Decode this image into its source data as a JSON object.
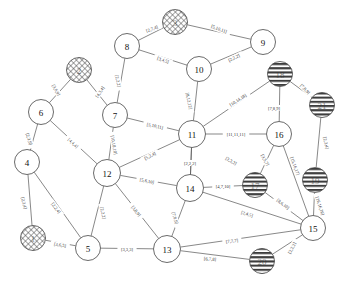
{
  "diagram": {
    "type": "undirected-weighted-graph",
    "title": "",
    "width": 347,
    "height": 285,
    "background": "#ffffff",
    "node_fill": "#ffffff",
    "node_stroke": "#444444",
    "edge_stroke": "#555555",
    "label_color": "#333333",
    "node_styles": {
      "plain": "white circle with black outline",
      "crosshatch": "circle filled with diagonal cross-hatch pattern (obscured label)",
      "stripe": "circle filled with horizontal stripe pattern (obscured label)"
    },
    "nodes": [
      {
        "id": "n3",
        "label": "3",
        "x": 175,
        "y": 22,
        "r": 12.5,
        "style": "crosshatch"
      },
      {
        "id": "n8",
        "label": "8",
        "x": 127,
        "y": 46,
        "r": 12.5,
        "style": "plain"
      },
      {
        "id": "n9",
        "label": "9",
        "x": 263,
        "y": 42,
        "r": 12.5,
        "style": "plain"
      },
      {
        "id": "n10",
        "label": "10",
        "x": 199,
        "y": 69,
        "r": 12.5,
        "style": "plain"
      },
      {
        "id": "n2",
        "label": "2",
        "x": 79,
        "y": 70,
        "r": 12.5,
        "style": "crosshatch"
      },
      {
        "id": "n18",
        "label": "18",
        "x": 280,
        "y": 74,
        "r": 12.5,
        "style": "stripe"
      },
      {
        "id": "n7",
        "label": "7",
        "x": 115,
        "y": 115,
        "r": 12.5,
        "style": "plain"
      },
      {
        "id": "n6",
        "label": "6",
        "x": 41,
        "y": 112,
        "r": 12.5,
        "style": "plain"
      },
      {
        "id": "n21",
        "label": "21",
        "x": 322,
        "y": 105,
        "r": 12.5,
        "style": "stripe"
      },
      {
        "id": "n11",
        "label": "11",
        "x": 192,
        "y": 134,
        "r": 13.5,
        "style": "plain"
      },
      {
        "id": "n16",
        "label": "16",
        "x": 279,
        "y": 134,
        "r": 12.5,
        "style": "plain"
      },
      {
        "id": "n4",
        "label": "4",
        "x": 27,
        "y": 162,
        "r": 12.5,
        "style": "plain"
      },
      {
        "id": "n12",
        "label": "12",
        "x": 107,
        "y": 173,
        "r": 13.5,
        "style": "plain"
      },
      {
        "id": "n14",
        "label": "14",
        "x": 190,
        "y": 188,
        "r": 13.5,
        "style": "plain"
      },
      {
        "id": "n17",
        "label": "17",
        "x": 255,
        "y": 185,
        "r": 12.5,
        "style": "stripe"
      },
      {
        "id": "n19",
        "label": "19",
        "x": 315,
        "y": 180,
        "r": 12.5,
        "style": "stripe"
      },
      {
        "id": "n15",
        "label": "15",
        "x": 313,
        "y": 228,
        "r": 12.5,
        "style": "plain"
      },
      {
        "id": "n1",
        "label": "1",
        "x": 33,
        "y": 238,
        "r": 12.5,
        "style": "crosshatch"
      },
      {
        "id": "n5",
        "label": "5",
        "x": 88,
        "y": 248,
        "r": 12.5,
        "style": "plain"
      },
      {
        "id": "n13",
        "label": "13",
        "x": 167,
        "y": 249,
        "r": 13.5,
        "style": "plain"
      },
      {
        "id": "n20",
        "label": "20",
        "x": 262,
        "y": 261,
        "r": 12.5,
        "style": "stripe"
      }
    ],
    "edges": [
      {
        "from": "n8",
        "to": "n3",
        "label": "[2,7,4]",
        "lx": 152,
        "ly": 29,
        "rot": -21
      },
      {
        "from": "n3",
        "to": "n9",
        "label": "[5,10,11]",
        "lx": 219,
        "ly": 29,
        "rot": 20
      },
      {
        "from": "n8",
        "to": "n10",
        "label": "[3,4,5]",
        "lx": 163,
        "ly": 60,
        "rot": 19
      },
      {
        "from": "n10",
        "to": "n9",
        "label": "[2,2,2]",
        "lx": 234,
        "ly": 58,
        "rot": -26
      },
      {
        "from": "n8",
        "to": "n7",
        "label": "[2,2,2]",
        "lx": 118,
        "ly": 81,
        "rot": 78
      },
      {
        "from": "n2",
        "to": "n6",
        "label": "[3,6,9]",
        "lx": 56,
        "ly": 90,
        "rot": 60
      },
      {
        "from": "n2",
        "to": "n7",
        "label": "[4,3,4]",
        "lx": 100,
        "ly": 92,
        "rot": -56
      },
      {
        "from": "n10",
        "to": "n11",
        "label": "[8,12,12]",
        "lx": 189,
        "ly": 101,
        "rot": 78
      },
      {
        "from": "n11",
        "to": "n18",
        "label": "[10,14,18]",
        "lx": 238,
        "ly": 100,
        "rot": -33
      },
      {
        "from": "n18",
        "to": "n21",
        "label": "[7,8,9]",
        "lx": 305,
        "ly": 89,
        "rot": 46
      },
      {
        "from": "n18",
        "to": "n16",
        "label": "[7,8,9]",
        "lx": 274,
        "ly": 108,
        "rot": 0
      },
      {
        "from": "n7",
        "to": "n11",
        "label": "[5,10,11]",
        "lx": 155,
        "ly": 126,
        "rot": 12
      },
      {
        "from": "n11",
        "to": "n16",
        "label": "[11,11,11]",
        "lx": 236,
        "ly": 134,
        "rot": 0
      },
      {
        "from": "n6",
        "to": "n4",
        "label": "[2,3,9]",
        "lx": 29,
        "ly": 139,
        "rot": 72
      },
      {
        "from": "n6",
        "to": "n12",
        "label": "[4,4,4]",
        "lx": 73,
        "ly": 143,
        "rot": 44
      },
      {
        "from": "n7",
        "to": "n12",
        "label": "[10,10,10]",
        "lx": 114,
        "ly": 145,
        "rot": 80
      },
      {
        "from": "n12",
        "to": "n11",
        "label": "[5,2,4]",
        "lx": 150,
        "ly": 156,
        "rot": -27
      },
      {
        "from": "n11",
        "to": "n14",
        "label": "[2,2,2]",
        "lx": 190,
        "ly": 163,
        "rot": 0
      },
      {
        "from": "n11",
        "to": "n14b",
        "label": "[2,2,2]",
        "lx": 231,
        "ly": 161,
        "rot": 30
      },
      {
        "from": "n21",
        "to": "n19",
        "label": "[2,3,4]",
        "lx": 326,
        "ly": 143,
        "rot": 77
      },
      {
        "from": "n16",
        "to": "n17",
        "label": "[3,5,7]",
        "lx": 265,
        "ly": 160,
        "rot": 61
      },
      {
        "from": "n16",
        "to": "n15",
        "label": "[15,16,17]",
        "lx": 295,
        "ly": 166,
        "rot": 70
      },
      {
        "from": "n12",
        "to": "n14",
        "label": "[5,6,10]",
        "lx": 147,
        "ly": 181,
        "rot": 11
      },
      {
        "from": "n14",
        "to": "n17",
        "label": "[4,7,10]",
        "lx": 223,
        "ly": 186,
        "rot": 0
      },
      {
        "from": "n17",
        "to": "n15",
        "label": "[8,6,10]",
        "lx": 283,
        "ly": 204,
        "rot": 38
      },
      {
        "from": "n19",
        "to": "n15",
        "label": "[16,16,16]",
        "lx": 320,
        "ly": 206,
        "rot": 72
      },
      {
        "from": "n4",
        "to": "n1",
        "label": "[2,3,4]",
        "lx": 24,
        "ly": 203,
        "rot": 76
      },
      {
        "from": "n4",
        "to": "n5",
        "label": "[2,2,4]",
        "lx": 56,
        "ly": 208,
        "rot": 53
      },
      {
        "from": "n12",
        "to": "n5",
        "label": "[2,2,2]",
        "lx": 103,
        "ly": 213,
        "rot": 78
      },
      {
        "from": "n12",
        "to": "n13",
        "label": "[3,8,9]",
        "lx": 136,
        "ly": 211,
        "rot": 51
      },
      {
        "from": "n14",
        "to": "n13",
        "label": "[7,8,9]",
        "lx": 175,
        "ly": 218,
        "rot": 73
      },
      {
        "from": "n14",
        "to": "n15",
        "label": "[2,4,5]",
        "lx": 247,
        "ly": 214,
        "rot": 17
      },
      {
        "from": "n1",
        "to": "n5",
        "label": "[3,6,5]",
        "lx": 60,
        "ly": 245,
        "rot": 9
      },
      {
        "from": "n5",
        "to": "n13",
        "label": "[3,3,3]",
        "lx": 127,
        "ly": 249,
        "rot": 0
      },
      {
        "from": "n13",
        "to": "n15",
        "label": "[7,7,7]",
        "lx": 232,
        "ly": 241,
        "rot": -7
      },
      {
        "from": "n13",
        "to": "n20",
        "label": "[6,7,8]",
        "lx": 210,
        "ly": 259,
        "rot": 4
      },
      {
        "from": "n20",
        "to": "n15",
        "label": "[2,2,2]",
        "lx": 292,
        "ly": 248,
        "rot": -63
      }
    ]
  }
}
